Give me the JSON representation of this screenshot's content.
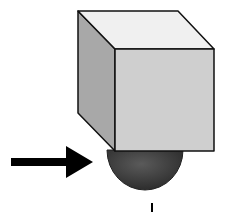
{
  "diagram": {
    "elements": [
      {
        "name": "cube",
        "faces": [
          "top",
          "left-side",
          "front"
        ]
      },
      {
        "name": "hemisphere",
        "color": "#3a3a3a"
      },
      {
        "name": "arrow",
        "direction": "right",
        "color": "#000000"
      },
      {
        "name": "tick-mark"
      }
    ],
    "colors": {
      "cube_top": "#f0f0f0",
      "cube_left": "#a8a8a8",
      "cube_front": "#cfcfcf",
      "sphere": "#3a3a3a",
      "outline": "#111111",
      "arrow": "#000000"
    }
  }
}
